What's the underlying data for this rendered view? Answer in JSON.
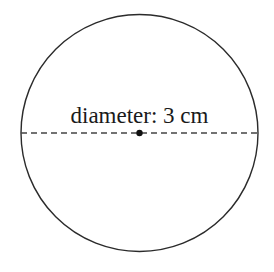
{
  "diagram": {
    "shape": "circle",
    "label": "diameter: 3 cm",
    "center": {
      "x": 139.5,
      "y": 133
    },
    "radius": 118.5,
    "diameter_line": {
      "x1": 21,
      "x2": 258,
      "y": 133,
      "style": "dashed"
    },
    "center_point": true,
    "colors": {
      "stroke": "#2b2b2b",
      "dashed": "#444444",
      "text": "#1a1a1a",
      "background": "#ffffff"
    }
  }
}
